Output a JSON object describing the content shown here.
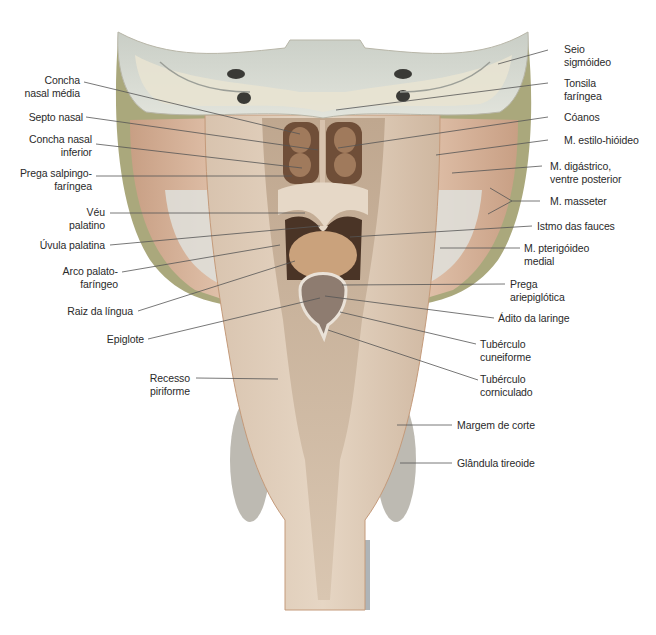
{
  "figure": {
    "colors": {
      "bone": "#d9dcd4",
      "bone_spongy": "#e7e4d6",
      "mucosa": "#cdb9a2",
      "muscle": "#d2ac92",
      "tonsil": "#c7a886",
      "fascia_green": "#a6a67a",
      "thyroid": "#b9b6ae",
      "leader_line": "#555555"
    }
  },
  "labels_left": [
    {
      "id": "concha-nasal-media",
      "text": "Concha\nnasal média"
    },
    {
      "id": "septo-nasal",
      "text": "Septo nasal"
    },
    {
      "id": "concha-nasal-inferior",
      "text": "Concha nasal\ninferior"
    },
    {
      "id": "prega-salpingofaringea",
      "text": "Prega salpingo-\nfaríngea"
    },
    {
      "id": "veu-palatino",
      "text": "Véu\npalatino"
    },
    {
      "id": "uvula-palatina",
      "text": "Úvula palatina"
    },
    {
      "id": "arco-palatofaringeo",
      "text": "Arco palato-\nfaríngeo"
    },
    {
      "id": "raiz-da-lingua",
      "text": "Raiz da língua"
    },
    {
      "id": "epiglote",
      "text": "Epiglote"
    },
    {
      "id": "recesso-piriforme",
      "text": "Recesso\npiriforme"
    }
  ],
  "labels_right": [
    {
      "id": "seio-sigmoideo",
      "text": "Seio\nsigmóideo"
    },
    {
      "id": "tonsila-faringea",
      "text": "Tonsila\nfaríngea"
    },
    {
      "id": "coanos",
      "text": "Cóanos"
    },
    {
      "id": "m-estilo-hioideo",
      "text": "M. estilo-hióideo"
    },
    {
      "id": "m-digastrico",
      "text": "M. digástrico,\nventre posterior"
    },
    {
      "id": "m-masseter",
      "text": "M. masseter"
    },
    {
      "id": "istmo-das-fauces",
      "text": "Istmo das fauces"
    },
    {
      "id": "m-pterigoideo-medial",
      "text": "M. pterigóideo\nmedial"
    },
    {
      "id": "prega-ariepiglotica",
      "text": "Prega\nariepiglótica"
    },
    {
      "id": "adito-da-laringe",
      "text": "Ádito da laringe"
    },
    {
      "id": "tuberculo-cuneiforme",
      "text": "Tubérculo\ncuneiforme"
    },
    {
      "id": "tuberculo-corniculado",
      "text": "Tubérculo\ncorniculado"
    },
    {
      "id": "margem-de-corte",
      "text": "Margem de corte"
    },
    {
      "id": "glandula-tireoide",
      "text": "Glândula tireoide"
    }
  ]
}
